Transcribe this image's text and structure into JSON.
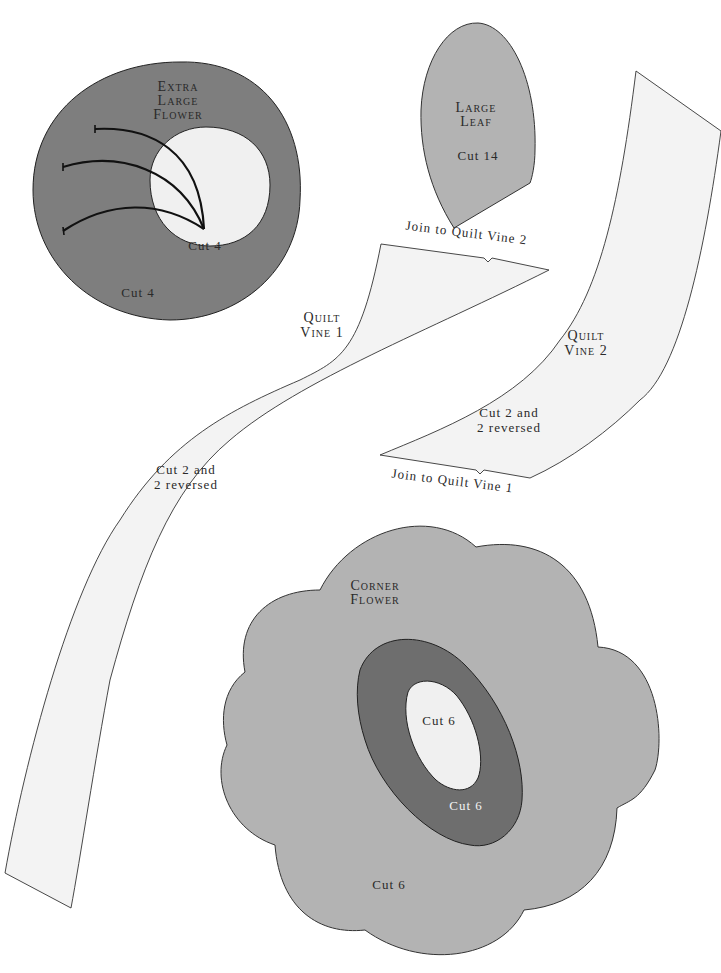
{
  "page": {
    "colors": {
      "background": "#ffffff",
      "dark_fabric": "#7e7e7e",
      "medium_fabric": "#b3b3b3",
      "light_fabric": "#f0f0f0",
      "outline": "#222222"
    }
  },
  "pieces": {
    "extra_large_flower": {
      "name_line1": "Extra",
      "name_line2": "Large",
      "name_line3": "Flower",
      "outer_cut": "Cut 4",
      "inner_cut": "Cut 4"
    },
    "large_leaf": {
      "name_line1": "Large",
      "name_line2": "Leaf",
      "cut": "Cut 14"
    },
    "quilt_vine_1": {
      "name_line1": "Quilt",
      "name_line2": "Vine 1",
      "cut_line1": "Cut 2 and",
      "cut_line2": "2 reversed",
      "join_label": "Join to Quilt Vine 2"
    },
    "quilt_vine_2": {
      "name_line1": "Quilt",
      "name_line2": "Vine 2",
      "cut_line1": "Cut 2 and",
      "cut_line2": "2 reversed",
      "join_label": "Join to Quilt Vine 1"
    },
    "corner_flower": {
      "name_line1": "Corner",
      "name_line2": "Flower",
      "outer_cut": "Cut 6",
      "middle_cut": "Cut 6",
      "inner_cut": "Cut 6"
    }
  }
}
